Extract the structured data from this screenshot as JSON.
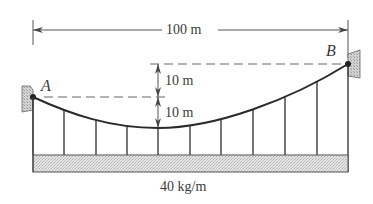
{
  "figure": {
    "type": "suspension-cable-diagram",
    "colors": {
      "line": "#2e2e2e",
      "dim_line": "#555555",
      "wall_fill": "#c8c8c8",
      "deck_fill": "#dcdcdc",
      "text": "#3a3a3a"
    }
  },
  "labels": {
    "span": "100 m",
    "upper_rise": "10 m",
    "lower_sag": "10 m",
    "point_a": "A",
    "point_b": "B",
    "load": "40 kg/m"
  },
  "geometry": {
    "span_m": 100,
    "sag_below_A_m": 10,
    "height_B_above_A_m": 10,
    "distributed_load_kg_per_m": 40,
    "hanger_count": 11
  }
}
